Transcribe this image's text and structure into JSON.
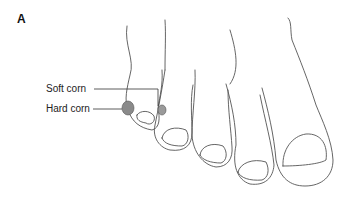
{
  "figure": {
    "panel_label": "A",
    "labels": {
      "soft_corn": "Soft corn",
      "hard_corn": "Hard corn"
    },
    "colors": {
      "outline": "#555555",
      "corn_fill": "#8a8a8a",
      "leader_line": "#333333"
    }
  }
}
